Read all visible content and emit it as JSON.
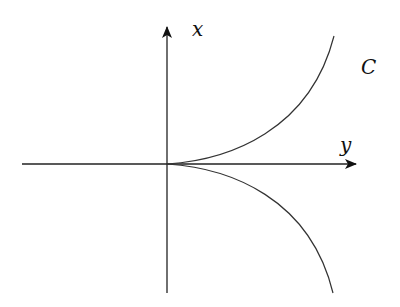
{
  "diagram": {
    "type": "cusp-curve",
    "axes": {
      "horizontal": {
        "label": "y"
      },
      "vertical": {
        "label": "x"
      }
    },
    "curve": {
      "label": "C",
      "color": "#333333"
    },
    "axis_color": "#111111"
  }
}
